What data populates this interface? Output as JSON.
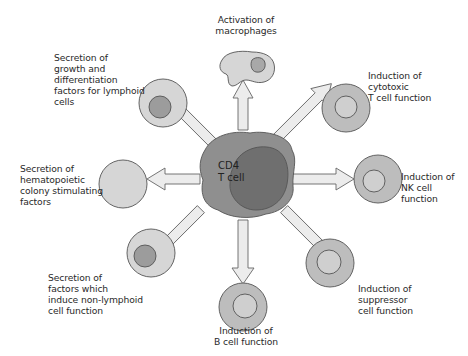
{
  "diagram": {
    "center": {
      "label": "CD4\nT cell"
    },
    "colors": {
      "background": "#ffffff",
      "center_cell": "#8f8f8f",
      "center_nucleus": "#6f6f6f",
      "cell_light": "#d6d6d6",
      "cell_medium": "#bdbdbd",
      "nucleus_dark": "#9c9c9c",
      "nucleus_light": "#d0d0d0",
      "arrow_fill": "#ececec",
      "outline": "#555555"
    },
    "targets": [
      {
        "id": "macrophages",
        "label": "Activation of\nmacrophages"
      },
      {
        "id": "cytotoxic-t",
        "label": "Induction of\ncytotoxic\nT cell function"
      },
      {
        "id": "nk",
        "label": "Induction of\nNK cell\nfunction"
      },
      {
        "id": "suppressor",
        "label": "Induction of\nsuppressor\ncell function"
      },
      {
        "id": "b-cell",
        "label": "Induction of\nB cell function"
      },
      {
        "id": "non-lymphoid",
        "label": "Secretion of\nfactors which\ninduce non-lymphoid\ncell function"
      },
      {
        "id": "hematopoietic",
        "label": "Secretion of\nhematopoietic\ncolony stimulating\nfactors"
      },
      {
        "id": "lymphoid-growth",
        "label": "Secretion of\ngrowth and\ndifferentiation\nfactors for lymphoid\ncells"
      }
    ]
  }
}
